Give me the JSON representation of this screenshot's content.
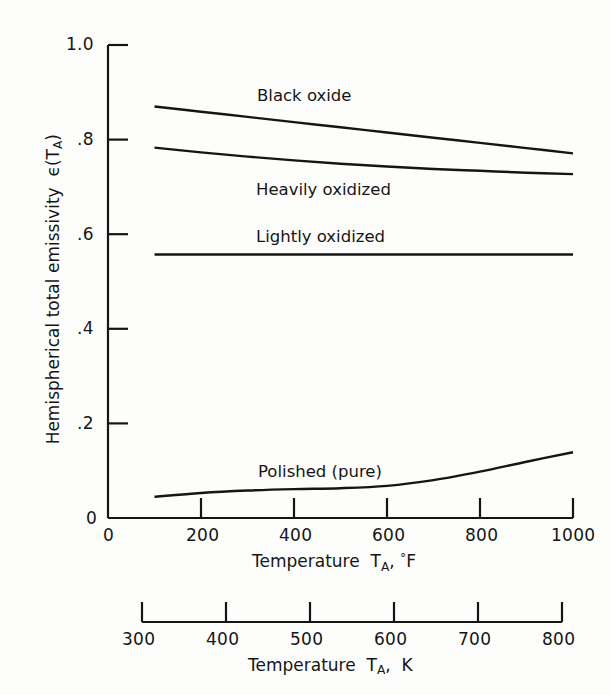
{
  "figure": {
    "background_color": "#fdfdfc",
    "line_color": "#151515"
  },
  "axes": {
    "y_label_prefix": "Hemispherical total emissivity",
    "y_label_symbol": "ϵ(T",
    "y_label_symbol_sub": "A",
    "y_label_symbol_close": ")",
    "y_ticks": [
      "0",
      ".2",
      ".4",
      ".6",
      ".8",
      "1.0"
    ],
    "x_primary_title_prefix": "Temperature",
    "x_primary_title_symbol": "T",
    "x_primary_title_sub": "A",
    "x_primary_title_comma": ",",
    "x_primary_title_unit_deg": "°",
    "x_primary_title_unit": "F",
    "x_primary_ticks": [
      "0",
      "200",
      "400",
      "600",
      "800",
      "1000"
    ],
    "x_secondary_title_prefix": "Temperature",
    "x_secondary_title_symbol": "T",
    "x_secondary_title_sub": "A",
    "x_secondary_title_comma": ",",
    "x_secondary_title_unit": "K",
    "x_secondary_ticks": [
      "300",
      "400",
      "500",
      "600",
      "700",
      "800"
    ]
  },
  "curve_labels": {
    "black_oxide": "Black oxide",
    "heavily_oxidized": "Heavily oxidized",
    "lightly_oxidized": "Lightly oxidized",
    "polished_pure": "Polished (pure)"
  },
  "chart_data": {
    "type": "line",
    "title": "",
    "xlabel": "Temperature T_A, °F",
    "ylabel": "Hemispherical total emissivity ϵ(T_A)",
    "xlim": [
      0,
      1000
    ],
    "ylim": [
      0,
      1.0
    ],
    "xticks": [
      0,
      200,
      400,
      600,
      800,
      1000
    ],
    "yticks": [
      0,
      0.2,
      0.4,
      0.6,
      0.8,
      1.0
    ],
    "grid": false,
    "legend": "inline-curve-labels",
    "secondary_x_axis": {
      "label": "Temperature T_A, K",
      "ticks": [
        300,
        400,
        500,
        600,
        700,
        800
      ],
      "range": [
        300,
        800
      ]
    },
    "series": [
      {
        "name": "Black oxide",
        "x": [
          100,
          200,
          300,
          400,
          500,
          600,
          700,
          800,
          900,
          1000
        ],
        "values": [
          0.87,
          0.859,
          0.848,
          0.837,
          0.826,
          0.815,
          0.804,
          0.793,
          0.782,
          0.771
        ]
      },
      {
        "name": "Heavily oxidized",
        "x": [
          100,
          200,
          300,
          400,
          500,
          600,
          700,
          800,
          900,
          1000
        ],
        "values": [
          0.783,
          0.773,
          0.764,
          0.756,
          0.749,
          0.743,
          0.738,
          0.734,
          0.73,
          0.727
        ]
      },
      {
        "name": "Lightly oxidized",
        "x": [
          100,
          200,
          300,
          400,
          500,
          600,
          700,
          800,
          900,
          1000
        ],
        "values": [
          0.557,
          0.557,
          0.557,
          0.557,
          0.557,
          0.557,
          0.557,
          0.557,
          0.557,
          0.557
        ]
      },
      {
        "name": "Polished (pure)",
        "x": [
          100,
          200,
          300,
          400,
          500,
          600,
          700,
          800,
          900,
          1000
        ],
        "values": [
          0.045,
          0.053,
          0.058,
          0.061,
          0.063,
          0.068,
          0.08,
          0.098,
          0.119,
          0.139
        ]
      }
    ]
  }
}
